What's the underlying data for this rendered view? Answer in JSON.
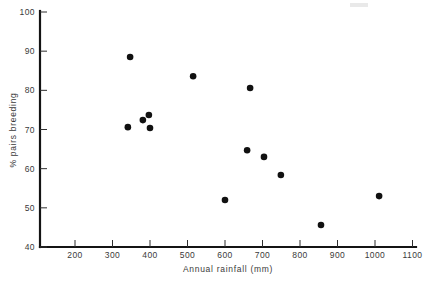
{
  "chart_data": {
    "type": "scatter",
    "title": "",
    "xlabel": "Annual rainfall (mm)",
    "ylabel": "% pairs breeding",
    "xlim": [
      150,
      1100
    ],
    "ylim": [
      40,
      100
    ],
    "grid": false,
    "legend": null,
    "xticks": [
      200,
      300,
      400,
      500,
      600,
      700,
      800,
      900,
      1000,
      1100
    ],
    "yticks": [
      40,
      50,
      60,
      70,
      80,
      90,
      100
    ],
    "xtick_labels": [
      "200",
      "300",
      "400",
      "500",
      "600",
      "700",
      "800",
      "900",
      "1000",
      "1100"
    ],
    "ytick_labels": [
      "40",
      "50",
      "60",
      "70",
      "80",
      "90",
      "100"
    ],
    "points": [
      {
        "x": 347,
        "y": 88.5
      },
      {
        "x": 341,
        "y": 70.6
      },
      {
        "x": 381,
        "y": 72.4
      },
      {
        "x": 397,
        "y": 73.7
      },
      {
        "x": 400,
        "y": 70.4
      },
      {
        "x": 515,
        "y": 83.6
      },
      {
        "x": 600,
        "y": 52.0
      },
      {
        "x": 659,
        "y": 64.7
      },
      {
        "x": 667,
        "y": 80.6
      },
      {
        "x": 704,
        "y": 63.0
      },
      {
        "x": 749,
        "y": 58.4
      },
      {
        "x": 856,
        "y": 45.6
      },
      {
        "x": 1011,
        "y": 53.0
      }
    ],
    "marker": {
      "shape": "circle",
      "size": 3.3,
      "color": "#111111"
    }
  },
  "axes": {
    "x_title": "Annual rainfall (mm)",
    "y_title": "% pairs breeding"
  }
}
